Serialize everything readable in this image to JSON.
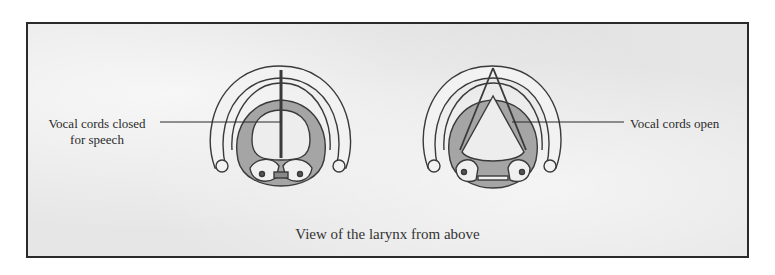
{
  "figure": {
    "caption": "View of the larynx from above",
    "colors": {
      "background": "#e6e6e6",
      "border": "#2a2a2a",
      "outline": "#3a3a3a",
      "tissue": "#9a9a9a",
      "cartilage": "#f0f0f0"
    }
  },
  "left_panel": {
    "state": "closed",
    "label_line1": "Vocal cords closed",
    "label_line2": "for speech"
  },
  "right_panel": {
    "state": "open",
    "label": "Vocal cords open"
  }
}
